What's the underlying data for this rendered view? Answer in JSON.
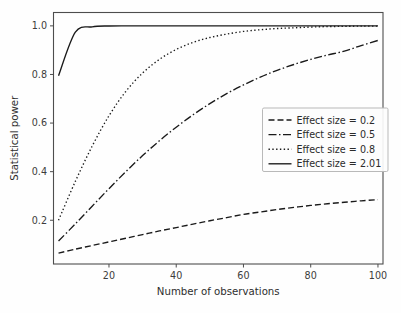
{
  "chart_data": {
    "type": "line",
    "title": "",
    "xlabel": "Number of observations",
    "ylabel": "Statistical power",
    "xlim": [
      3.5,
      101.5
    ],
    "ylim": [
      0.02,
      1.055
    ],
    "xticks": [
      20,
      40,
      60,
      80,
      100
    ],
    "xticklabels": [
      "20",
      "40",
      "60",
      "80",
      "100"
    ],
    "yticks": [
      0.2,
      0.4,
      0.6,
      0.8,
      1.0
    ],
    "yticklabels": [
      "0.2",
      "0.4",
      "0.6",
      "0.8",
      "1.0"
    ],
    "grid": false,
    "legend_position": "center right",
    "x": [
      5,
      10,
      15,
      20,
      25,
      30,
      35,
      40,
      45,
      50,
      55,
      60,
      65,
      70,
      75,
      80,
      85,
      90,
      95,
      100
    ],
    "series": [
      {
        "name": "Effect size = 0.2",
        "label": "Effect size = 0.2",
        "linestyle": "dashed",
        "dasharray": "6,3",
        "color": "#1a1a1a",
        "values": [
          0.065,
          0.081,
          0.096,
          0.111,
          0.126,
          0.141,
          0.156,
          0.17,
          0.184,
          0.198,
          0.211,
          0.224,
          0.234,
          0.244,
          0.253,
          0.261,
          0.268,
          0.274,
          0.28,
          0.285
        ]
      },
      {
        "name": "Effect size = 0.5",
        "label": "Effect size = 0.5",
        "linestyle": "dashdot",
        "dasharray": "8,2.5,1.5,2.5",
        "color": "#1a1a1a",
        "values": [
          0.115,
          0.185,
          0.258,
          0.33,
          0.4,
          0.466,
          0.527,
          0.583,
          0.634,
          0.68,
          0.721,
          0.757,
          0.789,
          0.817,
          0.841,
          0.862,
          0.88,
          0.896,
          0.919,
          0.94
        ]
      },
      {
        "name": "Effect size = 0.8",
        "label": "Effect size = 0.8",
        "linestyle": "dotted",
        "dasharray": "1.4,2.4",
        "color": "#1a1a1a",
        "values": [
          0.2,
          0.36,
          0.505,
          0.63,
          0.73,
          0.806,
          0.862,
          0.903,
          0.932,
          0.952,
          0.966,
          0.977,
          0.984,
          0.989,
          0.992,
          0.995,
          0.997,
          0.998,
          0.999,
          0.999
        ]
      },
      {
        "name": "Effect size = 2.01",
        "label": "Effect size = 2.01",
        "linestyle": "solid",
        "dasharray": "none",
        "color": "#1a1a1a",
        "values": [
          0.795,
          0.974,
          0.996,
          0.9995,
          1.0,
          1.0,
          1.0,
          1.0,
          1.0,
          1.0,
          1.0,
          1.0,
          1.0,
          1.0,
          1.0,
          1.0,
          1.0,
          1.0,
          1.0,
          1.0
        ]
      }
    ]
  },
  "axes": {
    "xlabel": "Number of observations",
    "ylabel": "Statistical power"
  },
  "legend": {
    "entries": [
      {
        "label": "Effect size = 0.2"
      },
      {
        "label": "Effect size = 0.5"
      },
      {
        "label": "Effect size = 0.8"
      },
      {
        "label": "Effect size = 2.01"
      }
    ]
  }
}
